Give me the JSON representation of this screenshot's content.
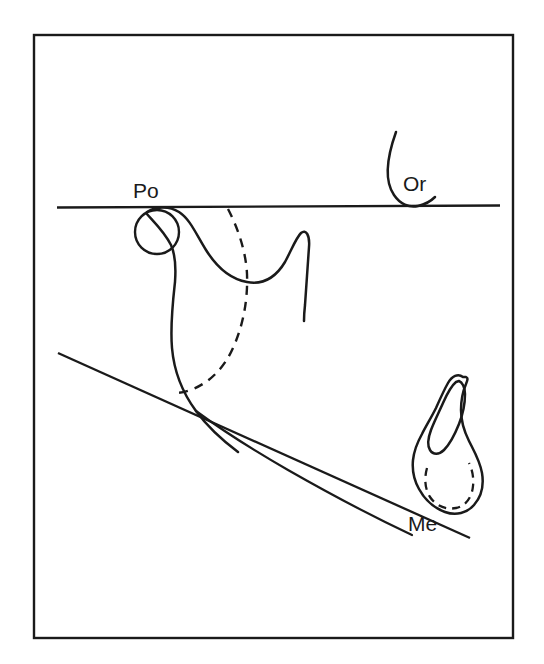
{
  "figure": {
    "background_color": "#ffffff",
    "stroke_color": "#1a1a1a",
    "frame": {
      "name": "figure-border",
      "x": 34,
      "y": 35,
      "width": 479,
      "height": 603
    }
  },
  "labels": {
    "porion": "Po",
    "orbitale": "Or",
    "menton": "Me"
  },
  "landmarks": [
    {
      "id": "po",
      "label": "Po",
      "description": "Porion - external auditory meatus",
      "x": 157,
      "y": 232
    },
    {
      "id": "or",
      "label": "Or",
      "description": "Orbitale - lowest point of orbital rim",
      "x": 417,
      "y": 205
    },
    {
      "id": "me",
      "label": "Me",
      "description": "Menton - lowest point of symphysis",
      "x": 435,
      "y": 510
    }
  ],
  "reference_lines": [
    {
      "id": "frankfort-horizontal",
      "name": "Frankfort horizontal plane",
      "from": [
        57,
        207
      ],
      "to": [
        500,
        205
      ]
    },
    {
      "id": "mandibular-plane",
      "name": "Mandibular plane",
      "from": [
        58,
        353
      ],
      "to": [
        470,
        538
      ]
    }
  ],
  "structures": [
    {
      "id": "porion-circle",
      "name": "External auditory meatus",
      "type": "circle",
      "style": "solid"
    },
    {
      "id": "orbitale-curve",
      "name": "Orbital rim",
      "type": "curve",
      "style": "solid"
    },
    {
      "id": "condyle-ramus",
      "name": "Condyle, sigmoid notch and coronoid process",
      "type": "curve",
      "style": "solid"
    },
    {
      "id": "posterior-ramus",
      "name": "Posterior border of ramus",
      "type": "curve",
      "style": "solid"
    },
    {
      "id": "pterygomaxillary-dashed",
      "name": "Posterior outline - dashed",
      "type": "curve",
      "style": "dashed"
    },
    {
      "id": "mandible-lower-border",
      "name": "Inferior border of mandible",
      "type": "curve",
      "style": "solid"
    },
    {
      "id": "symphysis-outline",
      "name": "Symphysis outline",
      "type": "closed-curve",
      "style": "solid"
    },
    {
      "id": "lower-incisor",
      "name": "Lower incisor",
      "type": "closed-curve",
      "style": "solid"
    },
    {
      "id": "symphysis-inner-dashed",
      "name": "Inner symphysis outline",
      "type": "curve",
      "style": "dashed"
    }
  ]
}
